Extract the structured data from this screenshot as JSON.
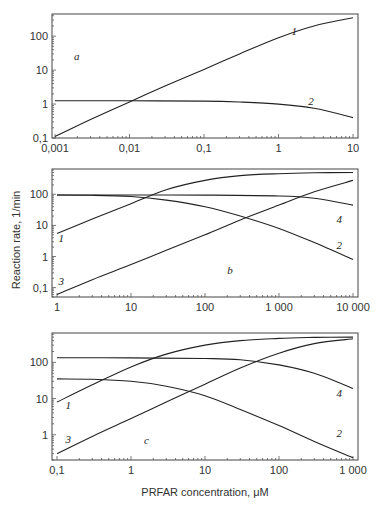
{
  "figure": {
    "ylabel": "Reaction rate, 1/min",
    "xlabel": "PRFAR concentration, μM"
  },
  "chart_data": [
    {
      "type": "line",
      "panel": "a",
      "xscale": "log",
      "yscale": "log",
      "xlim": [
        0.001,
        10
      ],
      "ylim": [
        0.1,
        450
      ],
      "xticks": [
        0.001,
        0.01,
        0.1,
        1,
        10
      ],
      "xtick_labels": [
        "0,001",
        "0,01",
        "0,1",
        "1",
        "10"
      ],
      "yticks": [
        0.1,
        1,
        10,
        100
      ],
      "ytick_labels": [
        "0,1",
        "1",
        "10",
        "100"
      ],
      "series": [
        {
          "name": "1",
          "x": [
            0.001,
            0.003,
            0.01,
            0.03,
            0.1,
            0.3,
            1,
            3,
            10
          ],
          "y": [
            0.11,
            0.35,
            1.15,
            3.4,
            10.5,
            30,
            90,
            200,
            350
          ],
          "label_at": [
            1.5,
            110
          ]
        },
        {
          "name": "2",
          "x": [
            0.001,
            0.01,
            0.1,
            0.3,
            1,
            3,
            10
          ],
          "y": [
            1.25,
            1.25,
            1.22,
            1.15,
            1.0,
            0.75,
            0.4
          ],
          "label_at": [
            2.5,
            0.95
          ]
        }
      ]
    },
    {
      "type": "line",
      "panel": "b",
      "xscale": "log",
      "yscale": "log",
      "xlim": [
        1,
        10000
      ],
      "ylim": [
        0.05,
        650
      ],
      "xticks": [
        1,
        10,
        100,
        1000,
        10000
      ],
      "xtick_labels": [
        "1",
        "10",
        "100",
        "1 000",
        "10 000"
      ],
      "yticks": [
        0.1,
        1,
        10,
        100
      ],
      "ytick_labels": [
        "0,1",
        "1",
        "10",
        "100"
      ],
      "series": [
        {
          "name": "1",
          "x": [
            1,
            3,
            10,
            30,
            100,
            300,
            1000,
            3000,
            10000
          ],
          "y": [
            5.5,
            16,
            50,
            140,
            280,
            400,
            460,
            490,
            500
          ],
          "label_at": [
            1.05,
            3
          ]
        },
        {
          "name": "2",
          "x": [
            1,
            3,
            10,
            30,
            100,
            300,
            1000,
            3000,
            10000
          ],
          "y": [
            95,
            93,
            85,
            65,
            40,
            20,
            8,
            2.8,
            0.8
          ],
          "label_at": [
            6000,
            1.7
          ]
        },
        {
          "name": "3",
          "x": [
            1,
            3,
            10,
            30,
            100,
            300,
            1000,
            3000,
            10000
          ],
          "y": [
            0.06,
            0.18,
            0.55,
            1.6,
            5,
            15,
            45,
            120,
            280
          ],
          "label_at": [
            1.05,
            0.12
          ]
        },
        {
          "name": "4",
          "x": [
            1,
            10,
            100,
            1000,
            3000,
            10000
          ],
          "y": [
            95,
            95,
            94,
            88,
            75,
            45
          ],
          "label_at": [
            6000,
            12
          ]
        }
      ],
      "panel_label_at": [
        200,
        0.28
      ]
    },
    {
      "type": "line",
      "panel": "c",
      "xscale": "log",
      "yscale": "log",
      "xlim": [
        0.1,
        1000
      ],
      "ylim": [
        0.2,
        650
      ],
      "xticks": [
        0.1,
        1,
        10,
        100,
        1000
      ],
      "xtick_labels": [
        "0,1",
        "1",
        "10",
        "100",
        "1 000"
      ],
      "yticks": [
        1,
        10,
        100
      ],
      "ytick_labels": [
        "1",
        "10",
        "100"
      ],
      "series": [
        {
          "name": "1",
          "x": [
            0.1,
            0.3,
            1,
            3,
            10,
            30,
            100,
            300,
            1000
          ],
          "y": [
            8,
            24,
            75,
            170,
            300,
            400,
            460,
            490,
            500
          ],
          "label_at": [
            0.13,
            5
          ]
        },
        {
          "name": "2",
          "x": [
            0.1,
            0.3,
            1,
            3,
            10,
            30,
            100,
            300,
            1000
          ],
          "y": [
            35,
            34,
            30,
            22,
            12,
            5,
            1.8,
            0.65,
            0.23
          ],
          "label_at": [
            600,
            0.85
          ]
        },
        {
          "name": "3",
          "x": [
            0.1,
            0.3,
            1,
            3,
            10,
            30,
            100,
            300,
            1000
          ],
          "y": [
            0.3,
            0.9,
            2.8,
            8,
            25,
            70,
            180,
            330,
            450
          ],
          "label_at": [
            0.13,
            0.6
          ]
        },
        {
          "name": "4",
          "x": [
            0.1,
            1,
            10,
            30,
            100,
            300,
            1000
          ],
          "y": [
            135,
            133,
            128,
            118,
            85,
            50,
            19
          ],
          "label_at": [
            600,
            11
          ]
        }
      ],
      "panel_label_at": [
        1.5,
        0.55
      ]
    }
  ],
  "panels_text": {
    "a": "a",
    "b": "b",
    "c": "c"
  }
}
